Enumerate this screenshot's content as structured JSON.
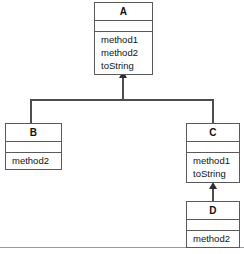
{
  "diagram": {
    "type": "uml-class-diagram",
    "background_color": "#ffffff",
    "border_color": "#5a5a5a",
    "connector_color": "#4d4d4d",
    "text_color": "#111111",
    "footer_rule_color": "#9a9a9a",
    "classes": [
      {
        "id": "A",
        "name": "A",
        "attributes": [],
        "operations": [
          "method1",
          "method2",
          "toString"
        ]
      },
      {
        "id": "B",
        "name": "B",
        "attributes": [],
        "operations": [
          "method2"
        ]
      },
      {
        "id": "C",
        "name": "C",
        "attributes": [],
        "operations": [
          "method1",
          "toString"
        ]
      },
      {
        "id": "D",
        "name": "D",
        "attributes": [],
        "operations": [
          "method2"
        ]
      }
    ],
    "relationships": [
      {
        "kind": "generalization",
        "from": "B",
        "to": "A"
      },
      {
        "kind": "generalization",
        "from": "C",
        "to": "A"
      },
      {
        "kind": "generalization",
        "from": "D",
        "to": "C"
      }
    ]
  }
}
